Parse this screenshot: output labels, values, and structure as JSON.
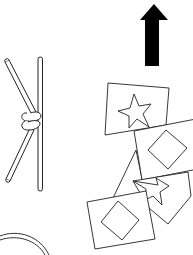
{
  "scene": {
    "description": "Line-drawing illustration of an upward arrow, a knot tied between two sticks, overlapping cards showing stars and diamonds, and a partial arc",
    "background": "#ffffff",
    "stroke_color": "#222222",
    "fill_color": "#000000"
  },
  "objects": [
    {
      "name": "up-arrow",
      "kind": "arrow",
      "direction": "up",
      "filled": true
    },
    {
      "name": "sticks-with-knot",
      "kind": "knot",
      "sticks": 2
    },
    {
      "name": "card-star-1",
      "kind": "card",
      "symbol": "star"
    },
    {
      "name": "card-diamond-1",
      "kind": "card",
      "symbol": "diamond"
    },
    {
      "name": "triangle-card",
      "kind": "triangle"
    },
    {
      "name": "card-star-2",
      "kind": "card",
      "symbol": "star"
    },
    {
      "name": "card-diamond-2",
      "kind": "card",
      "symbol": "diamond"
    },
    {
      "name": "partial-arc",
      "kind": "arc",
      "double_line": true
    }
  ]
}
